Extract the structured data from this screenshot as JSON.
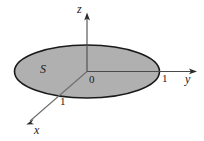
{
  "figure": {
    "name": "unit-disk-in-yz-plane-3d-axes",
    "canvas": {
      "width": 204,
      "height": 141,
      "background": "#ffffff"
    },
    "surface": {
      "label": "S",
      "shape": "ellipse",
      "fill_color": "#b0b0b0",
      "stroke_color": "#1a1a1a",
      "center": {
        "x": 87,
        "y": 71.5
      },
      "radius_x": 72.5,
      "radius_y": 26.5
    },
    "origin": {
      "label": "0",
      "x": 87,
      "y": 71.5
    },
    "axes": [
      {
        "name": "z",
        "label": "z",
        "from": {
          "x": 87,
          "y": 71.5
        },
        "to": {
          "x": 87,
          "y": 15
        },
        "color": "#3a3a3a",
        "label_pos": {
          "x": 79,
          "y": 13
        }
      },
      {
        "name": "y",
        "label": "y",
        "from": {
          "x": 87,
          "y": 71.5
        },
        "to": {
          "x": 196,
          "y": 71.5
        },
        "color": "#3a3a3a",
        "label_pos": {
          "x": 186,
          "y": 83
        }
      },
      {
        "name": "x",
        "label": "x",
        "from": {
          "x": 87,
          "y": 71.5
        },
        "to": {
          "x": 28,
          "y": 123
        },
        "color": "#6e6e6e",
        "label_pos": {
          "x": 36,
          "y": 133
        }
      }
    ],
    "ticks": [
      {
        "axis": "y",
        "label": "1",
        "x": 162,
        "y": 82
      },
      {
        "axis": "x",
        "label": "1",
        "x": 60,
        "y": 105
      }
    ],
    "label_s_pos": {
      "x": 40,
      "y": 73
    }
  }
}
